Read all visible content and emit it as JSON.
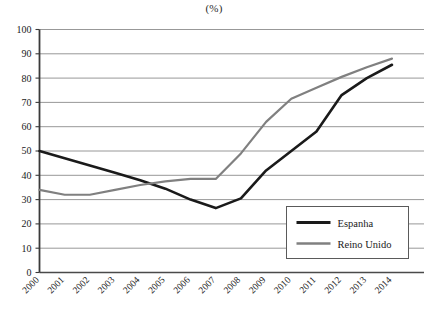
{
  "chart_data": {
    "type": "line",
    "title": "(%)",
    "xlabel": "",
    "ylabel": "",
    "ylim": [
      0,
      100
    ],
    "ytick_step": 10,
    "grid": true,
    "legend_position": "inside-bottom-right",
    "categories": [
      "2000",
      "2001",
      "2002",
      "2003",
      "2004",
      "2005",
      "2006",
      "2007",
      "2008",
      "2009",
      "2010",
      "2011",
      "2012",
      "2013",
      "2014"
    ],
    "yticks": [
      "0",
      "10",
      "20",
      "30",
      "40",
      "50",
      "60",
      "70",
      "80",
      "90",
      "100"
    ],
    "series": [
      {
        "name": "Espanha",
        "color": "#1a1a1a",
        "values": [
          50,
          47,
          44,
          41,
          38,
          34.5,
          30,
          26.5,
          30.5,
          42,
          50,
          58,
          73,
          80,
          85.5
        ]
      },
      {
        "name": "Reino Unido",
        "color": "#808080",
        "values": [
          34,
          32,
          32,
          34,
          36,
          37.5,
          38.5,
          38.5,
          49,
          62,
          71.5,
          76,
          80.5,
          84.5,
          88
        ]
      }
    ]
  },
  "legend": {
    "items": [
      {
        "label": "Espanha"
      },
      {
        "label": "Reino Unido"
      }
    ]
  }
}
